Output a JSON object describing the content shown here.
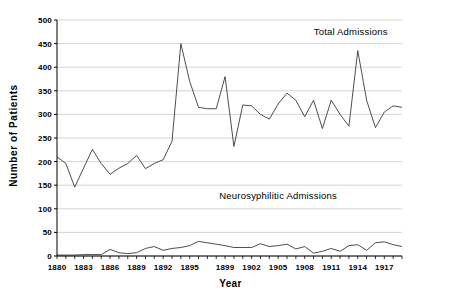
{
  "chart_data": {
    "type": "line",
    "title": "",
    "xlabel": "Year",
    "ylabel": "Number  of  Patients",
    "ylim": [
      0,
      500
    ],
    "ytick_step": 50,
    "yticks": [
      0,
      50,
      100,
      150,
      200,
      250,
      300,
      350,
      400,
      450,
      500
    ],
    "xlim": [
      1880,
      1919
    ],
    "xticks_labeled": [
      1880,
      1883,
      1886,
      1889,
      1892,
      1895,
      1899,
      1902,
      1905,
      1908,
      1911,
      1914,
      1917
    ],
    "xtick_step_minor": 1,
    "grid": "horizontal",
    "legend_position": "inline-annotations",
    "line_color": "#3a3a3a",
    "grid_color": "#c9c9c9",
    "axis_color": "#000000",
    "annotations": [
      {
        "text": "Total  Admissions",
        "x": 1913.2,
        "y": 468
      },
      {
        "text": "Neurosyphilitic Admissions",
        "x": 1905.0,
        "y": 120
      }
    ],
    "x": [
      1880,
      1881,
      1882,
      1883,
      1884,
      1885,
      1886,
      1887,
      1888,
      1889,
      1890,
      1891,
      1892,
      1893,
      1894,
      1895,
      1896,
      1897,
      1898,
      1899,
      1900,
      1901,
      1902,
      1903,
      1904,
      1905,
      1906,
      1907,
      1908,
      1909,
      1910,
      1911,
      1912,
      1913,
      1914,
      1915,
      1916,
      1917,
      1918,
      1919
    ],
    "series": [
      {
        "name": "Total  Admissions",
        "values": [
          210,
          196,
          146,
          186,
          226,
          196,
          173,
          186,
          196,
          213,
          185,
          196,
          204,
          243,
          450,
          370,
          315,
          312,
          312,
          380,
          232,
          320,
          318,
          300,
          290,
          322,
          345,
          330,
          295,
          330,
          270,
          330,
          300,
          275,
          435,
          330,
          272,
          305,
          318,
          315
        ]
      },
      {
        "name": "Neurosyphilitic Admissions",
        "values": [
          2,
          2,
          2,
          3,
          3,
          3,
          14,
          7,
          5,
          7,
          16,
          20,
          12,
          16,
          18,
          22,
          31,
          28,
          25,
          22,
          18,
          18,
          18,
          26,
          20,
          22,
          25,
          15,
          20,
          6,
          10,
          16,
          10,
          22,
          24,
          12,
          28,
          30,
          24,
          20
        ]
      }
    ]
  }
}
